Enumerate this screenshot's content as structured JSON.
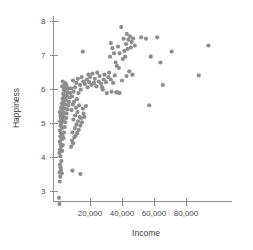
{
  "chart_data": {
    "type": "scatter",
    "title": "",
    "xlabel": "Income",
    "ylabel": "Happiness",
    "xlim": [
      0,
      97000
    ],
    "ylim": [
      2.6,
      8.2
    ],
    "xticks": [
      20000,
      40000,
      60000,
      80000
    ],
    "xtick_labels": [
      "20,000",
      "40,000",
      "60,000",
      "80,000"
    ],
    "yticks": [
      3,
      4,
      5,
      6,
      7,
      8
    ],
    "ytick_labels": [
      "3",
      "4",
      "5",
      "6",
      "7",
      "8"
    ],
    "grid": false,
    "legend": null,
    "marker_color": "#8d8d8d",
    "axis_color": "#8e8e8e",
    "marker_size": 2.1,
    "points": [
      [
        600,
        2.8
      ],
      [
        900,
        2.62
      ],
      [
        1100,
        3.28
      ],
      [
        1400,
        3.42
      ],
      [
        1000,
        3.55
      ],
      [
        1600,
        3.7
      ],
      [
        1200,
        3.78
      ],
      [
        1800,
        3.62
      ],
      [
        2100,
        3.88
      ],
      [
        1500,
        4.02
      ],
      [
        2400,
        3.52
      ],
      [
        900,
        4.12
      ],
      [
        1300,
        4.22
      ],
      [
        2000,
        4.3
      ],
      [
        2600,
        4.18
      ],
      [
        1700,
        4.38
      ],
      [
        1100,
        4.45
      ],
      [
        2300,
        4.52
      ],
      [
        3000,
        4.35
      ],
      [
        1400,
        4.6
      ],
      [
        2800,
        4.62
      ],
      [
        1900,
        4.7
      ],
      [
        1200,
        4.78
      ],
      [
        3400,
        4.55
      ],
      [
        2500,
        4.85
      ],
      [
        1600,
        4.92
      ],
      [
        3800,
        4.72
      ],
      [
        2100,
        4.98
      ],
      [
        1300,
        5.05
      ],
      [
        4200,
        4.88
      ],
      [
        2900,
        5.08
      ],
      [
        1800,
        5.15
      ],
      [
        1500,
        5.22
      ],
      [
        4600,
        5.02
      ],
      [
        3300,
        5.18
      ],
      [
        2300,
        5.28
      ],
      [
        1100,
        5.32
      ],
      [
        5000,
        5.15
      ],
      [
        3700,
        5.3
      ],
      [
        2700,
        5.4
      ],
      [
        1900,
        5.45
      ],
      [
        5400,
        5.28
      ],
      [
        4100,
        5.42
      ],
      [
        3100,
        5.52
      ],
      [
        2400,
        5.58
      ],
      [
        5900,
        5.4
      ],
      [
        4500,
        5.55
      ],
      [
        3500,
        5.65
      ],
      [
        2800,
        5.72
      ],
      [
        6300,
        5.52
      ],
      [
        5000,
        5.68
      ],
      [
        3900,
        5.78
      ],
      [
        3200,
        5.85
      ],
      [
        6800,
        5.62
      ],
      [
        5500,
        5.8
      ],
      [
        4400,
        5.92
      ],
      [
        3600,
        5.98
      ],
      [
        7200,
        5.75
      ],
      [
        6000,
        5.9
      ],
      [
        4900,
        6.02
      ],
      [
        4000,
        6.1
      ],
      [
        7700,
        5.88
      ],
      [
        6500,
        6.02
      ],
      [
        5300,
        6.12
      ],
      [
        4400,
        6.18
      ],
      [
        2600,
        6.08
      ],
      [
        3000,
        6.22
      ],
      [
        8200,
        4.3
      ],
      [
        8800,
        4.48
      ],
      [
        9400,
        4.4
      ],
      [
        10200,
        4.58
      ],
      [
        9000,
        4.72
      ],
      [
        11000,
        4.62
      ],
      [
        10500,
        4.85
      ],
      [
        12000,
        4.7
      ],
      [
        11500,
        4.95
      ],
      [
        13000,
        4.8
      ],
      [
        12500,
        5.05
      ],
      [
        14000,
        4.92
      ],
      [
        13500,
        5.18
      ],
      [
        15000,
        5.02
      ],
      [
        9600,
        5.1
      ],
      [
        10800,
        5.22
      ],
      [
        12200,
        5.32
      ],
      [
        8500,
        5.38
      ],
      [
        11200,
        5.45
      ],
      [
        14500,
        5.15
      ],
      [
        16000,
        5.28
      ],
      [
        9200,
        5.55
      ],
      [
        10000,
        5.62
      ],
      [
        13200,
        5.52
      ],
      [
        8800,
        5.78
      ],
      [
        11800,
        5.7
      ],
      [
        15500,
        5.42
      ],
      [
        9800,
        5.92
      ],
      [
        12800,
        5.88
      ],
      [
        8200,
        6.02
      ],
      [
        10600,
        6.05
      ],
      [
        14200,
        5.98
      ],
      [
        16500,
        5.18
      ],
      [
        13800,
        6.12
      ],
      [
        11400,
        6.18
      ],
      [
        9400,
        6.25
      ],
      [
        17500,
        5.5
      ],
      [
        15800,
        6.22
      ],
      [
        12400,
        6.3
      ],
      [
        18500,
        6.05
      ],
      [
        16800,
        6.15
      ],
      [
        19500,
        6.2
      ],
      [
        14800,
        6.35
      ],
      [
        21000,
        6.12
      ],
      [
        18000,
        6.28
      ],
      [
        22500,
        6.18
      ],
      [
        20000,
        6.35
      ],
      [
        24000,
        6.08
      ],
      [
        19000,
        6.42
      ],
      [
        23000,
        6.3
      ],
      [
        25500,
        6.22
      ],
      [
        21500,
        6.45
      ],
      [
        27000,
        6.15
      ],
      [
        26000,
        6.38
      ],
      [
        28500,
        6.28
      ],
      [
        24500,
        6.48
      ],
      [
        30000,
        6.2
      ],
      [
        29000,
        6.42
      ],
      [
        31500,
        6.35
      ],
      [
        27500,
        6.05
      ],
      [
        33000,
        6.28
      ],
      [
        32000,
        6.48
      ],
      [
        34500,
        6.18
      ],
      [
        35500,
        6.4
      ],
      [
        30500,
        5.88
      ],
      [
        33500,
        5.92
      ],
      [
        36500,
        5.9
      ],
      [
        28000,
        5.98
      ],
      [
        15500,
        7.1
      ],
      [
        14000,
        3.5
      ],
      [
        9000,
        3.6
      ],
      [
        32500,
        6.95
      ],
      [
        34000,
        7.2
      ],
      [
        35000,
        7.05
      ],
      [
        33000,
        7.35
      ],
      [
        36000,
        6.78
      ],
      [
        37500,
        7.25
      ],
      [
        38500,
        7.05
      ],
      [
        36800,
        6.68
      ],
      [
        39500,
        7.82
      ],
      [
        38000,
        6.62
      ],
      [
        40500,
        6.88
      ],
      [
        41500,
        7.12
      ],
      [
        42500,
        7.32
      ],
      [
        41000,
        7.48
      ],
      [
        43500,
        7.18
      ],
      [
        44000,
        7.45
      ],
      [
        42000,
        6.95
      ],
      [
        45000,
        7.55
      ],
      [
        43000,
        7.62
      ],
      [
        46000,
        7.38
      ],
      [
        45500,
        7.22
      ],
      [
        47000,
        7.48
      ],
      [
        44500,
        6.52
      ],
      [
        46500,
        6.42
      ],
      [
        48000,
        7.28
      ],
      [
        40000,
        6.25
      ],
      [
        38500,
        5.88
      ],
      [
        37000,
        5.9
      ],
      [
        42800,
        6.38
      ],
      [
        52000,
        7.52
      ],
      [
        55000,
        7.48
      ],
      [
        58000,
        6.95
      ],
      [
        57000,
        5.52
      ],
      [
        62000,
        7.52
      ],
      [
        64000,
        6.78
      ],
      [
        65500,
        6.12
      ],
      [
        71000,
        7.1
      ],
      [
        88000,
        6.4
      ],
      [
        94000,
        7.28
      ]
    ]
  },
  "axis": {
    "y_label": "Happiness",
    "x_label": "Income"
  }
}
